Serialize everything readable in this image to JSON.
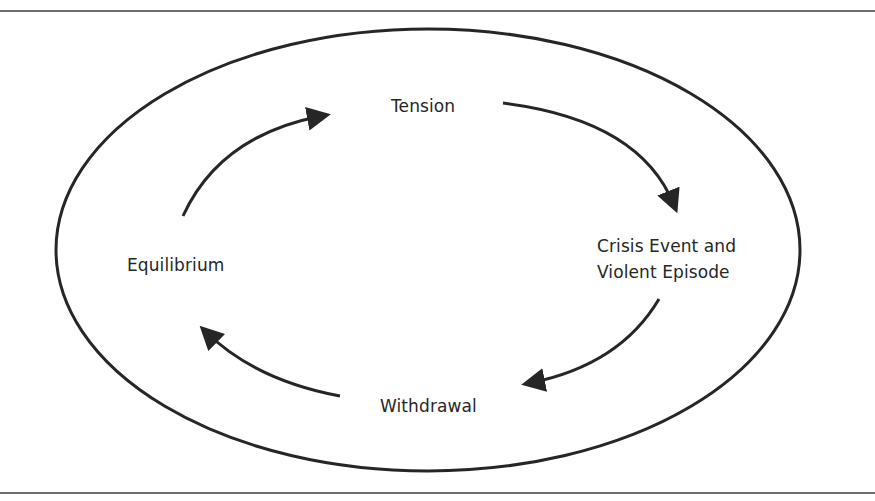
{
  "diagram": {
    "type": "cycle",
    "stages": [
      {
        "id": "tension",
        "label": "Tension"
      },
      {
        "id": "crisis",
        "label_lines": [
          "Crisis Event and",
          "Violent Episode"
        ]
      },
      {
        "id": "withdrawal",
        "label": "Withdrawal"
      },
      {
        "id": "equilibrium",
        "label": "Equilibrium"
      }
    ],
    "flow": [
      {
        "from": "Equilibrium",
        "to": "Tension"
      },
      {
        "from": "Tension",
        "to": "Crisis Event and Violent Episode"
      },
      {
        "from": "Crisis Event and Violent Episode",
        "to": "Withdrawal"
      },
      {
        "from": "Withdrawal",
        "to": "Equilibrium"
      }
    ],
    "colors": {
      "stroke": "#262626",
      "frame": "#6e6e6e",
      "background": "#ffffff"
    }
  }
}
